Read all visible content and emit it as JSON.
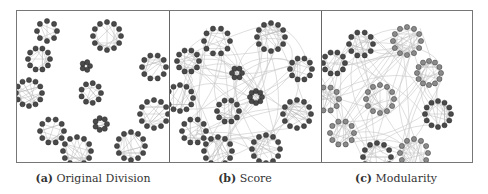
{
  "figure": {
    "panels": [
      {
        "id": "a",
        "label": "(a)",
        "caption": "Original Division",
        "inter_edges": 0,
        "node_color": "#555555",
        "clusters": [
          {
            "cx": 30,
            "cy": 20,
            "r": 10,
            "n": 8,
            "dark": true
          },
          {
            "cx": 90,
            "cy": 25,
            "r": 14,
            "n": 12,
            "dark": true
          },
          {
            "cx": 22,
            "cy": 48,
            "r": 11,
            "n": 10,
            "dark": true
          },
          {
            "cx": 69,
            "cy": 55,
            "r": 4,
            "n": 5,
            "dark": true
          },
          {
            "cx": 137,
            "cy": 56,
            "r": 12,
            "n": 10,
            "dark": true
          },
          {
            "cx": 12,
            "cy": 82,
            "r": 13,
            "n": 12,
            "dark": true
          },
          {
            "cx": 74,
            "cy": 82,
            "r": 10,
            "n": 9,
            "dark": true
          },
          {
            "cx": 137,
            "cy": 103,
            "r": 14,
            "n": 12,
            "dark": true
          },
          {
            "cx": 84,
            "cy": 113,
            "r": 6,
            "n": 7,
            "dark": true
          },
          {
            "cx": 35,
            "cy": 120,
            "r": 12,
            "n": 10,
            "dark": true
          },
          {
            "cx": 114,
            "cy": 135,
            "r": 14,
            "n": 12,
            "dark": true
          },
          {
            "cx": 60,
            "cy": 140,
            "r": 14,
            "n": 12,
            "dark": true
          }
        ]
      },
      {
        "id": "b",
        "label": "(b)",
        "caption": "Score",
        "inter_edges": 70,
        "node_color": "#555555",
        "clusters": [
          {
            "cx": 47,
            "cy": 30,
            "r": 13,
            "n": 10,
            "dark": true
          },
          {
            "cx": 101,
            "cy": 26,
            "r": 14,
            "n": 12,
            "dark": true
          },
          {
            "cx": 18,
            "cy": 50,
            "r": 11,
            "n": 10,
            "dark": true
          },
          {
            "cx": 67,
            "cy": 62,
            "r": 5,
            "n": 6,
            "dark": true
          },
          {
            "cx": 131,
            "cy": 58,
            "r": 11,
            "n": 10,
            "dark": true
          },
          {
            "cx": 10,
            "cy": 87,
            "r": 13,
            "n": 12,
            "dark": true
          },
          {
            "cx": 86,
            "cy": 86,
            "r": 6,
            "n": 8,
            "dark": true
          },
          {
            "cx": 58,
            "cy": 100,
            "r": 11,
            "n": 10,
            "dark": true
          },
          {
            "cx": 127,
            "cy": 103,
            "r": 14,
            "n": 12,
            "dark": true
          },
          {
            "cx": 24,
            "cy": 120,
            "r": 12,
            "n": 10,
            "dark": true
          },
          {
            "cx": 48,
            "cy": 140,
            "r": 14,
            "n": 12,
            "dark": true
          },
          {
            "cx": 96,
            "cy": 138,
            "r": 14,
            "n": 12,
            "dark": true
          }
        ]
      },
      {
        "id": "c",
        "label": "(c)",
        "caption": "Modularity",
        "inter_edges": 70,
        "node_color": "#8a8a8a",
        "clusters": [
          {
            "cx": 39,
            "cy": 33,
            "r": 12,
            "n": 10,
            "dark": true
          },
          {
            "cx": 85,
            "cy": 30,
            "r": 14,
            "n": 12,
            "dark": false
          },
          {
            "cx": 12,
            "cy": 52,
            "r": 11,
            "n": 10,
            "dark": true
          },
          {
            "cx": 107,
            "cy": 62,
            "r": 12,
            "n": 12,
            "dark": false
          },
          {
            "cx": 5,
            "cy": 88,
            "r": 12,
            "n": 10,
            "dark": false
          },
          {
            "cx": 58,
            "cy": 88,
            "r": 14,
            "n": 12,
            "dark": false
          },
          {
            "cx": 116,
            "cy": 103,
            "r": 13,
            "n": 12,
            "dark": true
          },
          {
            "cx": 20,
            "cy": 122,
            "r": 12,
            "n": 10,
            "dark": false
          },
          {
            "cx": 55,
            "cy": 146,
            "r": 14,
            "n": 12,
            "dark": true
          },
          {
            "cx": 92,
            "cy": 142,
            "r": 14,
            "n": 12,
            "dark": false
          }
        ]
      }
    ]
  }
}
